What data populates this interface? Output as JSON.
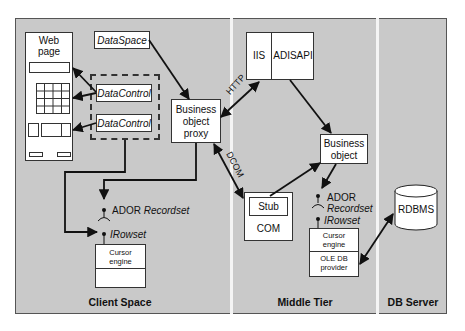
{
  "diagram": {
    "sections": [
      {
        "id": "client",
        "label": "Client Space"
      },
      {
        "id": "middle",
        "label": "Middle Tier"
      },
      {
        "id": "db",
        "label": "DB Server"
      }
    ],
    "client": {
      "web_page": {
        "title_line1": "Web",
        "title_line2": "page"
      },
      "data_space": "DataSpace",
      "data_controls": [
        "DataControl",
        "DataControl"
      ],
      "business_object_proxy": {
        "line1": "Business",
        "line2": "object",
        "line3": "proxy"
      },
      "ador_recordset": {
        "prefix": "ADOR",
        "name": "Recordset"
      },
      "irowset": "IRowset",
      "cursor_engine": {
        "line1": "Cursor",
        "line2": "engine"
      }
    },
    "middle": {
      "iis": "IIS",
      "adisapi": "ADISAPI",
      "business_object": {
        "line1": "Business",
        "line2": "object"
      },
      "stub": "Stub",
      "com": "COM",
      "ador_recordset": {
        "prefix": "ADOR",
        "name": "Recordset"
      },
      "irowset": "IRowset",
      "cursor_engine": {
        "line1": "Cursor",
        "line2": "engine"
      },
      "oledb_provider": {
        "line1": "OLE DB",
        "line2": "provider"
      }
    },
    "db": {
      "rdbms": "RDBMS"
    },
    "connections": [
      {
        "from": "DataSpace",
        "to": "Business object proxy",
        "label": ""
      },
      {
        "from": "Business object proxy",
        "to": "IIS",
        "label": "HTTP",
        "bidirectional": true
      },
      {
        "from": "Business object proxy",
        "to": "Stub/COM",
        "label": "DCOM",
        "bidirectional": true
      },
      {
        "from": "ADISAPI",
        "to": "Business object",
        "label": ""
      },
      {
        "from": "Stub",
        "to": "Business object",
        "label": ""
      },
      {
        "from": "Business object",
        "to": "Middle ADOR Recordset",
        "label": ""
      },
      {
        "from": "OLE DB provider",
        "to": "RDBMS",
        "label": "",
        "bidirectional": true
      },
      {
        "from": "DataControl",
        "to": "Web page elements",
        "label": ""
      },
      {
        "from": "DataControls",
        "to": "Client IRowset",
        "label": ""
      },
      {
        "from": "Business object proxy",
        "to": "Client ADOR Recordset",
        "label": ""
      }
    ],
    "colors": {
      "background": "#c9c9c9",
      "divider": "#f4f4f4",
      "box_fill": "#ffffff",
      "stroke": "#111111"
    }
  }
}
